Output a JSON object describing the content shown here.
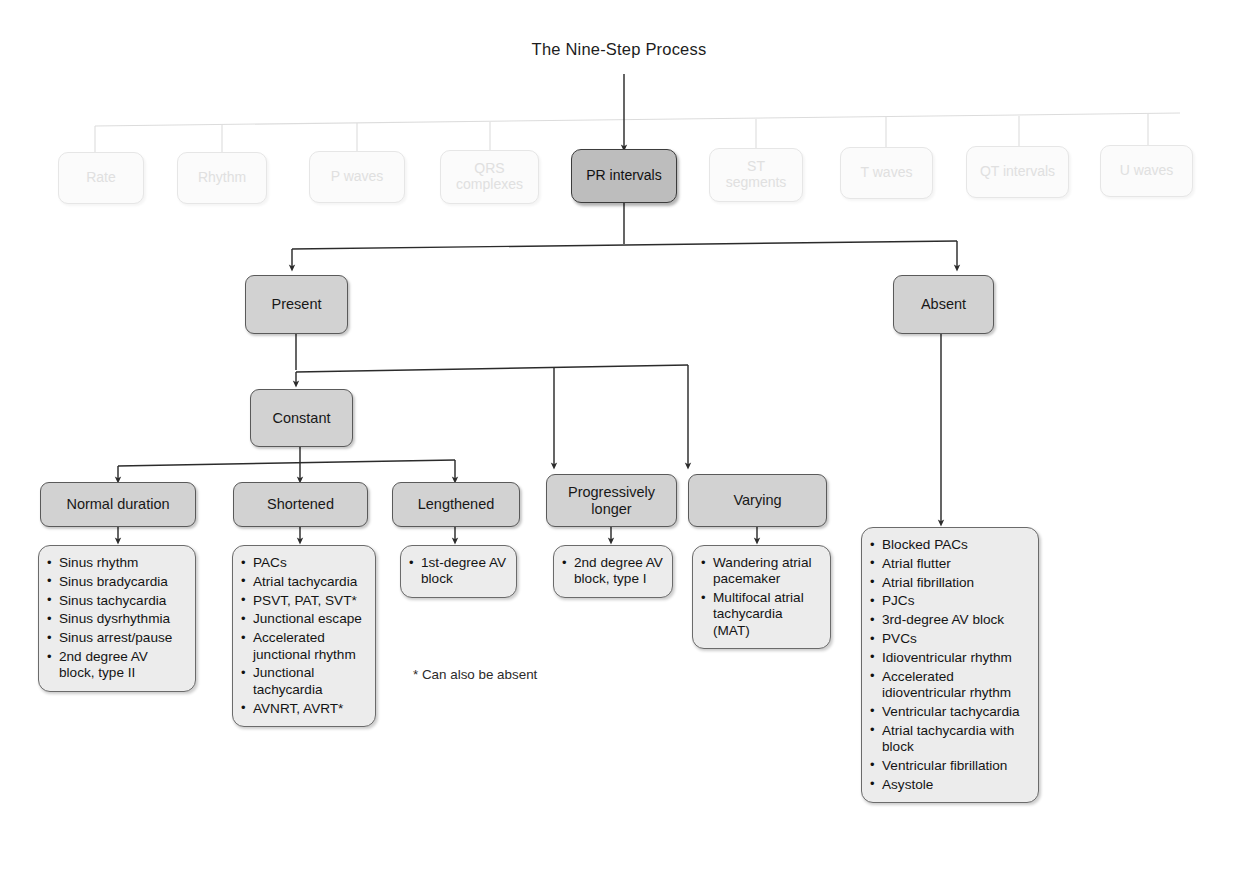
{
  "title": "The Nine-Step Process",
  "colors": {
    "node_fill": "#d2d2d2",
    "active_fill": "#bdbdbd",
    "faded_fill": "#fbfbfb",
    "list_fill": "#ececec",
    "border": "#5a5a5a",
    "line": "#2b2b2b",
    "faded_line": "#dcdcdc"
  },
  "steps": [
    {
      "label": "Rate",
      "state": "faded"
    },
    {
      "label": "Rhythm",
      "state": "faded"
    },
    {
      "label": "P waves",
      "state": "faded"
    },
    {
      "label": "QRS complexes",
      "state": "faded"
    },
    {
      "label": "PR intervals",
      "state": "active"
    },
    {
      "label": "ST segments",
      "state": "faded"
    },
    {
      "label": "T waves",
      "state": "faded"
    },
    {
      "label": "QT intervals",
      "state": "faded"
    },
    {
      "label": "U waves",
      "state": "faded"
    }
  ],
  "nodes": {
    "present": "Present",
    "absent": "Absent",
    "constant": "Constant",
    "normal_duration": "Normal duration",
    "shortened": "Shortened",
    "lengthened": "Lengthened",
    "progressively_longer": "Progressively longer",
    "varying": "Varying"
  },
  "lists": {
    "normal_duration": [
      "Sinus rhythm",
      "Sinus bradycardia",
      "Sinus tachycardia",
      "Sinus dysrhythmia",
      "Sinus arrest/pause",
      "2nd degree AV block, type II"
    ],
    "shortened": [
      "PACs",
      "Atrial tachycardia",
      "PSVT, PAT, SVT*",
      "Junctional escape",
      "Accelerated junctional rhythm",
      "Junctional tachycardia",
      "AVNRT, AVRT*"
    ],
    "lengthened": [
      "1st-degree AV block"
    ],
    "progressively_longer": [
      "2nd degree AV block, type I"
    ],
    "varying": [
      "Wandering atrial pacemaker",
      "Multifocal atrial tachycardia (MAT)"
    ],
    "absent": [
      "Blocked PACs",
      "Atrial flutter",
      "Atrial fibrillation",
      "PJCs",
      "3rd-degree AV block",
      "PVCs",
      "Idioventricular rhythm",
      "Accelerated idioventricular rhythm",
      "Ventricular tachycardia",
      "Atrial tachycardia with block",
      "Ventricular fibrillation",
      "Asystole"
    ]
  },
  "footnote": "* Can also be absent"
}
